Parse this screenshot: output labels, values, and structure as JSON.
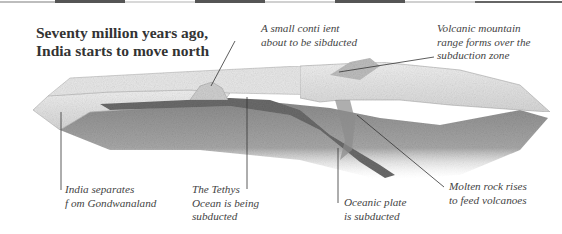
{
  "title": {
    "line1": "Seventy million years ago,",
    "line2": "India starts to move north"
  },
  "labels": {
    "small_continent": [
      "A small conti ient",
      "about to be sibducted"
    ],
    "volcanic_range": [
      "Volcanic mountain",
      "range forms over the",
      "subduction zone"
    ],
    "india_separates": [
      "India separates",
      "f om Gondwanaland"
    ],
    "tethys": [
      "The Tethys",
      "Ocean is being",
      "subducted"
    ],
    "oceanic_plate": [
      "Oceanic plate",
      "is subducted"
    ],
    "molten_rock": [
      "Molten rock rises",
      "to feed volcanoes"
    ]
  },
  "colors": {
    "strip_dark": "#555555",
    "strip_light": "#cfcfcf",
    "crust_light": "#e2e2e2",
    "mantle_dark": "#8a8a8a",
    "ocean_plate": "#6e6e6e",
    "text": "#444444"
  }
}
